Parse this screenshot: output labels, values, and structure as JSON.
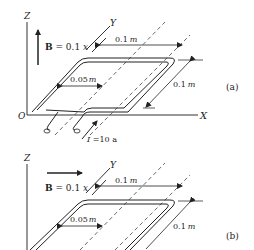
{
  "panels": [
    {
      "id": "a",
      "label": "(a)",
      "axes": {
        "z": "Z",
        "y": "Y",
        "x": "X",
        "origin": "O"
      },
      "field_label": "B = 0.1 x",
      "field_direction": "up (+Z)",
      "dim_top": "0.1 m",
      "dim_inner": "0.05 m",
      "dim_side": "0.1 m",
      "current_label": "I = 10 a"
    },
    {
      "id": "b",
      "label": "(b)",
      "axes": {
        "z": "Z",
        "y": "Y"
      },
      "field_label": "B = 0.1 x",
      "field_direction": "right (+X)",
      "dim_top": "0.1 m",
      "dim_inner": "0.05 m",
      "dim_side": "0.1 m"
    }
  ],
  "text": {
    "a_z": "Z",
    "a_y": "Y",
    "a_x": "X",
    "a_o": "O",
    "a_B": "B",
    "a_Beq": " = 0.1 ",
    "a_Bx": "x",
    "a_top_num": "0.1",
    "a_inner_num": "0.05",
    "a_side_num": "0.1",
    "m": "m",
    "a_label": "(a)",
    "a_I": "I",
    "a_Ieq": " =10 a",
    "b_z": "Z",
    "b_y": "Y",
    "b_B": "B",
    "b_Beq": " = 0.1 ",
    "b_Bx": "x",
    "b_top_num": "0.1",
    "b_inner_num": "0.05",
    "b_side_num": "0.1",
    "b_label": "(b)"
  }
}
